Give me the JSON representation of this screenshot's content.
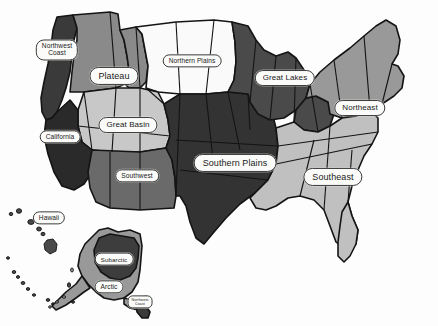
{
  "map": {
    "title": "Native American Culture Areas of the United States",
    "background_color": "#fdfdfd",
    "outline_color": "#141414",
    "label_fill": "#fbfbf9",
    "label_border": "#3a3a3a"
  },
  "regions": [
    {
      "id": "northwest-coast",
      "label": "Northwest\nCoast",
      "fill": "#3a3a3a",
      "label_x": 57,
      "label_y": 50,
      "size": "sm"
    },
    {
      "id": "plateau",
      "label": "Plateau",
      "fill": "#8a8a8a",
      "label_x": 114,
      "label_y": 76,
      "size": "lg"
    },
    {
      "id": "northern-plains",
      "label": "Northern Plains",
      "fill": "#fafafa",
      "label_x": 192,
      "label_y": 61,
      "size": "sm"
    },
    {
      "id": "great-lakes",
      "label": "Great Lakes",
      "fill": "#4a4a4a",
      "label_x": 285,
      "label_y": 78,
      "size": "md"
    },
    {
      "id": "northeast",
      "label": "Northeast",
      "fill": "#999999",
      "label_x": 360,
      "label_y": 108,
      "size": "md"
    },
    {
      "id": "california",
      "label": "California",
      "fill": "#2a2a2a",
      "label_x": 60,
      "label_y": 137,
      "size": "sm"
    },
    {
      "id": "great-basin",
      "label": "Great Basin",
      "fill": "#c8c8c8",
      "label_x": 128,
      "label_y": 125,
      "size": "md"
    },
    {
      "id": "southwest",
      "label": "Southwest",
      "fill": "#6a6a6a",
      "label_x": 137,
      "label_y": 176,
      "size": "sm"
    },
    {
      "id": "southern-plains",
      "label": "Southern Plains",
      "fill": "#333333",
      "label_x": 235,
      "label_y": 163,
      "size": "lg"
    },
    {
      "id": "southeast",
      "label": "Southeast",
      "fill": "#c0c0c0",
      "label_x": 333,
      "label_y": 177,
      "size": "lg"
    },
    {
      "id": "hawaii",
      "label": "Hawaii",
      "fill": "#4a4a4a",
      "label_x": 49,
      "label_y": 218,
      "size": "sm"
    },
    {
      "id": "subarctic",
      "label": "Subarctic",
      "fill": "#3d3d3d",
      "label_x": 114,
      "label_y": 259,
      "size": "tinyplus"
    },
    {
      "id": "arctic",
      "label": "Arctic",
      "fill": "#999999",
      "label_x": 109,
      "label_y": 287,
      "size": "sm"
    },
    {
      "id": "alaska-panhandle",
      "label": "Northwest\nCoast",
      "fill": "#3a3a3a",
      "label_x": 140,
      "label_y": 302,
      "size": "tiny"
    }
  ],
  "insets": [
    {
      "id": "hawaii-inset",
      "name": "Hawaiian Islands"
    },
    {
      "id": "alaska-inset",
      "name": "Alaska"
    }
  ]
}
